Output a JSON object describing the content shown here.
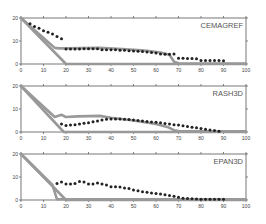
{
  "figure": {
    "width": 266,
    "height": 224,
    "colors": {
      "axis": "#555555",
      "tick_label": "#444444",
      "model_line": "#999999",
      "observed_points": "#222222",
      "panel_label": "#555555"
    }
  },
  "chart_data": [
    {
      "type": "line",
      "title": "CEMAGREF",
      "xlabel": "",
      "ylabel": "",
      "xlim": [
        0,
        100
      ],
      "ylim": [
        0,
        20
      ],
      "xticks": [
        0,
        10,
        20,
        30,
        40,
        50,
        60,
        70,
        80,
        90,
        100
      ],
      "yticks": [
        0,
        10,
        20
      ],
      "grid": false,
      "legend": null,
      "series": [
        {
          "name": "initial-profile",
          "style": "thick-line",
          "x": [
            0,
            20,
            100
          ],
          "y": [
            20,
            0,
            0
          ]
        },
        {
          "name": "model",
          "style": "thick-line",
          "x": [
            0,
            15,
            17,
            20,
            35,
            45,
            55,
            62,
            66,
            68,
            70,
            80,
            90,
            100
          ],
          "y": [
            20,
            7,
            6.8,
            6.8,
            7,
            6.5,
            5.8,
            5,
            4,
            1,
            0.3,
            0.2,
            0.2,
            0.2
          ]
        },
        {
          "name": "observed",
          "style": "points",
          "x": [
            4,
            6,
            8,
            10,
            12,
            14,
            16,
            18,
            20,
            22,
            24,
            26,
            28,
            30,
            32,
            34,
            36,
            38,
            40,
            42,
            44,
            46,
            48,
            50,
            52,
            54,
            56,
            58,
            60,
            62,
            64,
            66,
            68,
            70,
            72,
            74,
            76,
            78,
            80,
            82,
            84,
            86,
            88,
            90
          ],
          "y": [
            17.5,
            16.3,
            15.5,
            14.5,
            13.8,
            13,
            12,
            11,
            6.5,
            6.5,
            6.5,
            6.5,
            6.6,
            6.6,
            6.6,
            6.6,
            6.2,
            6.2,
            6.2,
            6.2,
            6.0,
            6.0,
            5.8,
            5.6,
            5.5,
            5.4,
            5.2,
            5.0,
            4.8,
            4.3,
            4.2,
            4.2,
            4.3,
            2.5,
            2.5,
            2.4,
            2.4,
            2.3,
            1.5,
            1.5,
            1.5,
            1.5,
            1.5,
            1.4
          ]
        }
      ]
    },
    {
      "type": "line",
      "title": "RASH3D",
      "xlabel": "",
      "ylabel": "",
      "xlim": [
        0,
        100
      ],
      "ylim": [
        0,
        20
      ],
      "xticks": [
        0,
        10,
        20,
        30,
        40,
        50,
        60,
        70,
        80,
        90,
        100
      ],
      "yticks": [
        0,
        10,
        20
      ],
      "grid": false,
      "legend": null,
      "series": [
        {
          "name": "initial-profile",
          "style": "thick-line",
          "x": [
            0,
            19,
            100
          ],
          "y": [
            20,
            0,
            0
          ]
        },
        {
          "name": "model",
          "style": "thick-line",
          "x": [
            0,
            15,
            18,
            20,
            25,
            35,
            40,
            50,
            60,
            65,
            68,
            70,
            80,
            90,
            100
          ],
          "y": [
            20,
            6.5,
            7.5,
            6.5,
            6.8,
            7,
            6.2,
            5,
            3.5,
            2.2,
            0.8,
            0.4,
            0.3,
            0.3,
            0.3
          ]
        },
        {
          "name": "observed",
          "style": "points",
          "x": [
            18,
            20,
            22,
            24,
            26,
            28,
            30,
            32,
            34,
            36,
            38,
            40,
            42,
            44,
            46,
            48,
            50,
            52,
            54,
            56,
            58,
            60,
            62,
            64,
            66,
            68,
            70,
            72,
            74,
            76,
            78,
            80,
            82,
            84,
            86,
            88
          ],
          "y": [
            3.5,
            2.8,
            3.0,
            3.2,
            3.5,
            3.8,
            4.0,
            4.5,
            4.8,
            5.2,
            5.5,
            5.6,
            5.6,
            5.6,
            5.5,
            5.4,
            5.2,
            5.0,
            4.8,
            4.6,
            4.4,
            4.2,
            4.0,
            3.7,
            3.5,
            3.2,
            3.0,
            2.7,
            2.4,
            2.1,
            1.8,
            1.5,
            1.2,
            0.9,
            0.6,
            0.3
          ]
        }
      ]
    },
    {
      "type": "line",
      "title": "EPAN3D",
      "xlabel": "",
      "ylabel": "",
      "xlim": [
        0,
        100
      ],
      "ylim": [
        0,
        20
      ],
      "xticks": [
        0,
        10,
        20,
        30,
        40,
        50,
        60,
        70,
        80,
        90,
        100
      ],
      "yticks": [
        0,
        10,
        20
      ],
      "grid": false,
      "legend": null,
      "series": [
        {
          "name": "initial-profile",
          "style": "thick-line",
          "x": [
            0,
            20,
            100
          ],
          "y": [
            20,
            0,
            0
          ]
        },
        {
          "name": "model",
          "style": "thick-line",
          "x": [
            0,
            14,
            16,
            100
          ],
          "y": [
            20,
            6.5,
            0.3,
            0.3
          ]
        },
        {
          "name": "observed",
          "style": "points",
          "x": [
            16,
            18,
            20,
            22,
            24,
            26,
            28,
            30,
            32,
            34,
            36,
            38,
            40,
            42,
            44,
            46,
            48,
            50,
            52,
            54,
            56,
            58,
            60,
            62,
            64,
            66,
            68,
            70,
            72,
            74,
            76,
            78,
            80,
            82,
            84,
            86,
            88,
            90
          ],
          "y": [
            7.2,
            7.8,
            7.0,
            7.0,
            7.2,
            8.0,
            7.8,
            7.0,
            7.0,
            7.4,
            7.0,
            6.5,
            5.8,
            5.8,
            5.6,
            5.2,
            5.0,
            4.4,
            4.0,
            3.6,
            3.4,
            3.0,
            2.8,
            2.6,
            2.3,
            2.0,
            1.6,
            1.2,
            0.8,
            0.6,
            0.5,
            0.4,
            0.3,
            0.3,
            0.3,
            0.3,
            0.3,
            0.3
          ]
        }
      ]
    }
  ],
  "panels": [
    {
      "label": "CEMAGREF"
    },
    {
      "label": "RASH3D"
    },
    {
      "label": "EPAN3D"
    }
  ]
}
